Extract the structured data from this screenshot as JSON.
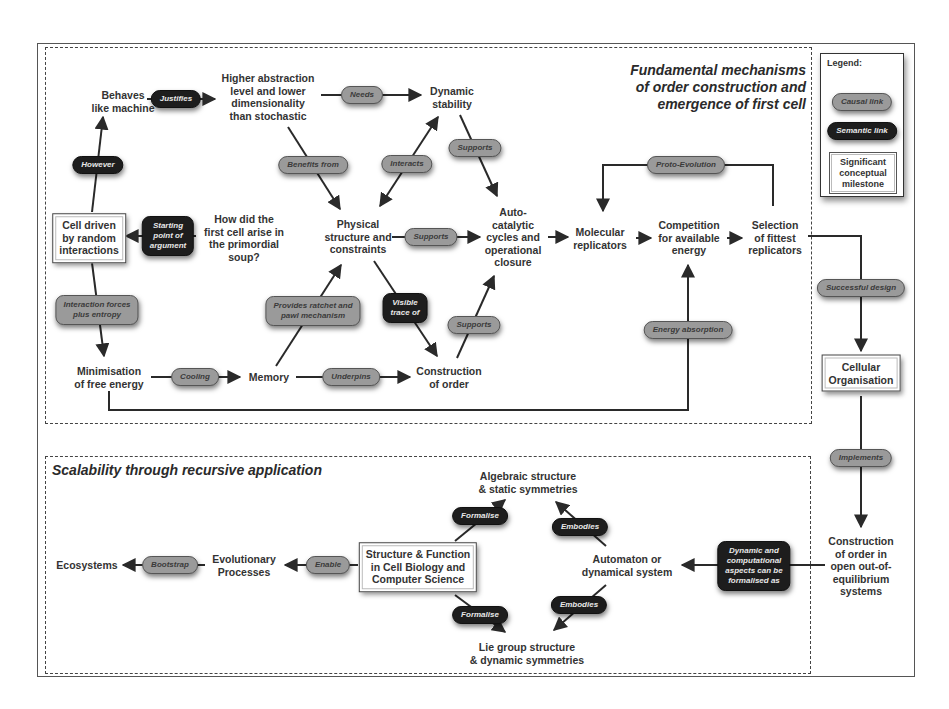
{
  "sections": {
    "top_title": [
      "Fundamental mechanisms",
      "of order construction and",
      "emergence of first cell"
    ],
    "bottom_title": "Scalability through recursive application"
  },
  "legend": {
    "title": "Legend:",
    "causal": "Causal link",
    "semantic": "Semantic link",
    "milestone": "Significant conceptual milestone"
  },
  "nodes": {
    "behaves_like_machine": "Behaves\nlike machine",
    "higher_abstraction": "Higher abstraction\nlevel and lower\ndimensionality\nthan stochastic",
    "dynamic_stability": "Dynamic\nstability",
    "cell_driven": "Cell driven\nby random\ninteractions",
    "how_did_cell_arise": "How did the\nfirst cell arise in\nthe primordial\nsoup?",
    "physical_structure": "Physical\nstructure and\nconstraints",
    "autocatalytic": "Auto-\ncatalytic\ncycles and\noperational\nclosure",
    "molecular_replicators": "Molecular\nreplicators",
    "competition": "Competition\nfor available\nenergy",
    "selection": "Selection\nof fittest\nreplicators",
    "minimisation": "Minimisation\nof free energy",
    "memory": "Memory",
    "construction_of_order": "Construction\nof order",
    "cellular_organisation": "Cellular\nOrganisation",
    "construction_open": "Construction\nof order in\nopen out-of-\nequilibrium\nsystems",
    "ecosystems": "Ecosystems",
    "evolutionary_processes": "Evolutionary\nProcesses",
    "structure_function": "Structure & Function\nin Cell Biology and\nComputer Science",
    "algebraic_structure": "Algebraic structure\n& static symmetries",
    "automaton": "Automaton or\ndynamical system",
    "lie_group": "Lie group structure\n& dynamic symmetries"
  },
  "links": {
    "justifies": "Justifies",
    "needs": "Needs",
    "however": "However",
    "benefits_from": "Benefits from",
    "interacts": "Interacts",
    "supports_1": "Supports",
    "starting_point": "Starting\npoint of\nargument",
    "supports_2": "Supports",
    "proto_evolution": "Proto-Evolution",
    "interaction_forces": "Interaction forces\nplus entropy",
    "provides_ratchet": "Provides ratchet and\npawl mechanism",
    "visible_trace": "Visible\ntrace of",
    "supports_3": "Supports",
    "energy_absorption": "Energy absorption",
    "cooling": "Cooling",
    "underpins": "Underpins",
    "successful_design": "Successful design",
    "implements": "Implements",
    "bootstrap": "Bootstrap",
    "enable": "Enable",
    "formalise_1": "Formalise",
    "formalise_2": "Formalise",
    "embodies_1": "Embodies",
    "embodies_2": "Embodies",
    "dynamic_computational": "Dynamic and\ncomputational\naspects can be\nformalised as"
  },
  "colors": {
    "causal_fill": "#9a9a9a",
    "semantic_fill": "#1d1d1d",
    "line": "#2a2a2a"
  }
}
